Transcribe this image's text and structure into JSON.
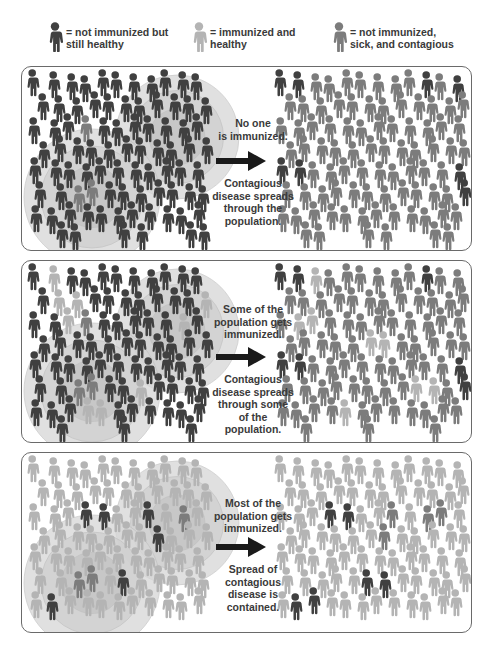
{
  "colors": {
    "unimmunized_healthy": "#404040",
    "immunized_healthy": "#b4b4b4",
    "sick": "#7c7c7c",
    "circle_fill": "#d6d6d6",
    "circle_inner": "#c4c4c4",
    "border": "#6a6a6a",
    "text": "#3a3a3a"
  },
  "legend": [
    {
      "icon": "person-dark-icon",
      "type": "unimmunized_healthy",
      "line1": "= not immunized but",
      "line2": "still healthy",
      "x": 47
    },
    {
      "icon": "person-light-icon",
      "type": "immunized_healthy",
      "line1": "= immunized and",
      "line2": "healthy",
      "x": 191
    },
    {
      "icon": "person-medium-icon",
      "type": "sick",
      "line1": "= not immunized,",
      "line2": "sick, and contagious",
      "x": 331
    }
  ],
  "panels": [
    {
      "id": "none-immunized",
      "top": 66,
      "height": 185,
      "caption_top": [
        "No one",
        "is immunized."
      ],
      "caption_bottom": [
        "Contagious",
        "disease spreads",
        "through the",
        "population."
      ],
      "left_base": "unimmunized_healthy",
      "left_exceptions": {
        "light": [],
        "sick": [
          [
            52,
            55
          ],
          [
            60,
            112
          ]
        ]
      },
      "right_base": "sick",
      "right_exceptions": {
        "light": [],
        "dark": [
          [
            260,
            0
          ],
          [
            395,
            0
          ],
          [
            260,
            90
          ],
          [
            440,
            105
          ],
          [
            430,
            10
          ]
        ]
      }
    },
    {
      "id": "some-immunized",
      "top": 260,
      "height": 183,
      "caption_top": [
        "Some of the",
        "population gets",
        "immunized."
      ],
      "caption_bottom": [
        "Contagious",
        "disease spreads",
        "through some",
        "of the population."
      ],
      "left_base": "unimmunized_healthy",
      "left_exceptions": {
        "light": [
          [
            30,
            5
          ],
          [
            40,
            40
          ],
          [
            150,
            45
          ],
          [
            110,
            110
          ],
          [
            175,
            20
          ],
          [
            60,
            140
          ]
        ],
        "sick": [
          [
            52,
            55
          ],
          [
            60,
            112
          ]
        ]
      },
      "right_base": "sick",
      "right_exceptions": {
        "light": [
          [
            275,
            5
          ],
          [
            280,
            45
          ],
          [
            350,
            60
          ],
          [
            395,
            125
          ],
          [
            318,
            135
          ],
          [
            440,
            5
          ]
        ],
        "dark": [
          [
            260,
            0
          ],
          [
            395,
            0
          ],
          [
            260,
            90
          ],
          [
            440,
            105
          ]
        ]
      }
    },
    {
      "id": "most-immunized",
      "top": 452,
      "height": 181,
      "caption_top": [
        "Most of the",
        "population gets",
        "immunized."
      ],
      "caption_bottom": [
        "Spread of",
        "contagious",
        "disease is",
        "contained."
      ],
      "left_base": "immunized_healthy",
      "left_exceptions": {
        "dark": [
          [
            65,
            45
          ],
          [
            122,
            60
          ],
          [
            98,
            110
          ],
          [
            25,
            135
          ]
        ],
        "sick": [
          [
            148,
            45
          ],
          [
            60,
            112
          ]
        ]
      },
      "right_base": "immunized_healthy",
      "right_exceptions": {
        "dark": [
          [
            310,
            45
          ],
          [
            345,
            110
          ],
          [
            275,
            135
          ]
        ],
        "sick": [
          [
            355,
            60
          ],
          [
            400,
            45
          ]
        ]
      }
    }
  ],
  "crowd": {
    "cols_left": [
      5,
      24,
      40,
      56,
      72,
      88,
      104,
      120,
      136,
      152,
      168
    ],
    "cols_right": [
      252,
      268,
      284,
      300,
      316,
      332,
      348,
      364,
      380,
      396,
      412,
      428,
      444
    ],
    "rows": [
      0,
      22,
      44,
      66,
      88,
      110,
      132,
      152
    ]
  }
}
